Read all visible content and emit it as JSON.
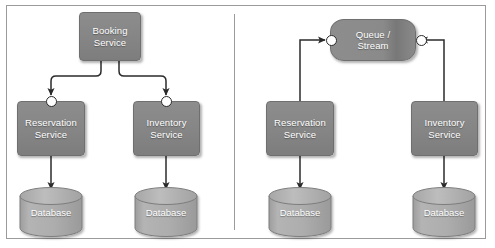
{
  "diagram": {
    "panels": [
      {
        "id": "left",
        "name": "synchronous-orchestration",
        "nodes": [
          {
            "id": "booking",
            "label": "Booking\nService",
            "line1": "Booking",
            "line2": "Service",
            "shape": "rounded-rect"
          },
          {
            "id": "reservation",
            "label": "Reservation\nService",
            "line1": "Reservation",
            "line2": "Service",
            "shape": "rounded-rect"
          },
          {
            "id": "inventory",
            "label": "Inventory\nService",
            "line1": "Inventory",
            "line2": "Service",
            "shape": "rounded-rect"
          },
          {
            "id": "db-reservation",
            "label": "Database",
            "shape": "cylinder"
          },
          {
            "id": "db-inventory",
            "label": "Database",
            "shape": "cylinder"
          }
        ],
        "edges": [
          {
            "from": "booking",
            "to": "reservation",
            "style": "elbow-arrow",
            "endpoint": "port-circle"
          },
          {
            "from": "booking",
            "to": "inventory",
            "style": "elbow-arrow",
            "endpoint": "port-circle"
          },
          {
            "from": "reservation",
            "to": "db-reservation",
            "style": "straight-arrow"
          },
          {
            "from": "inventory",
            "to": "db-inventory",
            "style": "straight-arrow"
          }
        ]
      },
      {
        "id": "right",
        "name": "asynchronous-queue",
        "nodes": [
          {
            "id": "queue",
            "label": "Queue /\nStream",
            "line1": "Queue /",
            "line2": "Stream",
            "shape": "pill"
          },
          {
            "id": "reservation2",
            "label": "Reservation\nService",
            "line1": "Reservation",
            "line2": "Service",
            "shape": "rounded-rect"
          },
          {
            "id": "inventory2",
            "label": "Inventory\nService",
            "line1": "Inventory",
            "line2": "Service",
            "shape": "rounded-rect"
          },
          {
            "id": "db-reservation2",
            "label": "Database",
            "shape": "cylinder"
          },
          {
            "id": "db-inventory2",
            "label": "Database",
            "shape": "cylinder"
          }
        ],
        "edges": [
          {
            "from": "reservation2",
            "to": "queue",
            "style": "elbow-arrow",
            "endpoint": "port-circle"
          },
          {
            "from": "inventory2",
            "to": "queue",
            "style": "elbow-arrow",
            "endpoint": "port-circle"
          },
          {
            "from": "reservation2",
            "to": "db-reservation2",
            "style": "straight-arrow"
          },
          {
            "from": "inventory2",
            "to": "db-inventory2",
            "style": "straight-arrow"
          }
        ]
      }
    ],
    "labels": {
      "booking_service_l1": "Booking",
      "booking_service_l2": "Service",
      "reservation_service_l1": "Reservation",
      "reservation_service_l2": "Service",
      "inventory_service_l1": "Inventory",
      "inventory_service_l2": "Service",
      "queue_stream_l1": "Queue /",
      "queue_stream_l2": "Stream",
      "database": "Database"
    },
    "colors": {
      "node_fill": "#878787",
      "node_stroke": "#6f6f6f",
      "cylinder_fill": "#ababab",
      "cylinder_stroke": "#7d7d7d",
      "edge_stroke": "#2b2b2b",
      "frame_stroke": "#9b9b9b",
      "label_text": "#ffffff",
      "page_background": "#ffffff"
    }
  }
}
